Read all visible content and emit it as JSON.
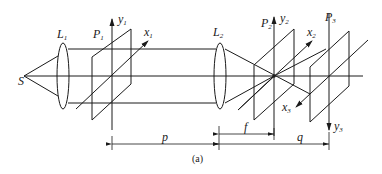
{
  "diagram": {
    "caption": "(a)",
    "source": {
      "label": "S"
    },
    "lenses": [
      {
        "label": "L",
        "sub": "1"
      },
      {
        "label": "L",
        "sub": "2"
      }
    ],
    "planes": [
      {
        "label": "P",
        "sub": "1",
        "x_axis": {
          "label": "x",
          "sub": "1"
        },
        "y_axis": {
          "label": "y",
          "sub": "1"
        }
      },
      {
        "label": "P",
        "sub": "2",
        "x_axis": {
          "label": "x",
          "sub": "2"
        },
        "y_axis": {
          "label": "y",
          "sub": "2"
        }
      },
      {
        "label": "P",
        "sub": "3",
        "x_axis": {
          "label": "x",
          "sub": "3"
        },
        "y_axis": {
          "label": "y",
          "sub": "3"
        }
      }
    ],
    "dimensions": [
      {
        "label": "p"
      },
      {
        "label": "f"
      },
      {
        "label": "q"
      }
    ],
    "colors": {
      "stroke": "#1a1a1a",
      "background": "#ffffff"
    }
  }
}
